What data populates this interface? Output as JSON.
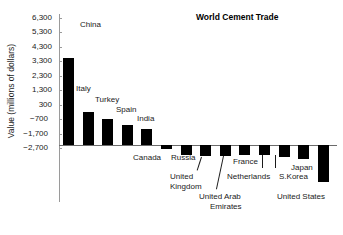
{
  "chart_data": {
    "type": "bar",
    "title": "World Cement Trade",
    "xlabel": "",
    "ylabel": "Value (millions of dollars)",
    "ylim": [
      -2700,
      6300
    ],
    "ytick_values": [
      6300,
      5300,
      4300,
      3300,
      2300,
      1300,
      300,
      -700,
      -1700,
      -2700
    ],
    "ytick_labels": [
      "6,300",
      "5,300",
      "4,300",
      "3,300",
      "2,300",
      "1,300",
      "300",
      "−700",
      "−1,700",
      "−2,700"
    ],
    "grid": false,
    "legend": "none",
    "categories": [
      "China",
      "Italy",
      "Turkey",
      "Spain",
      "India",
      "Canada",
      "Russia",
      "United Kingdom",
      "United Arab Emirates",
      "France",
      "Netherlands",
      "S.Korea",
      "Japan",
      "United States"
    ],
    "values": [
      6150,
      2350,
      1800,
      1400,
      1150,
      -250,
      -700,
      -750,
      -750,
      -700,
      -700,
      -850,
      -1000,
      -2600
    ],
    "bar_color": "#000000"
  },
  "labels": {
    "china": "China",
    "italy": "Italy",
    "turkey": "Turkey",
    "spain": "Spain",
    "india": "India",
    "canada": "Canada",
    "russia": "Russia",
    "united_kingdom_l1": "United",
    "united_kingdom_l2": "Kingdom",
    "uae_l1": "United Arab",
    "uae_l2": "Emirates",
    "france": "France",
    "netherlands": "Netherlands",
    "skorea": "S.Korea",
    "japan": "Japan",
    "united_states": "United States"
  }
}
